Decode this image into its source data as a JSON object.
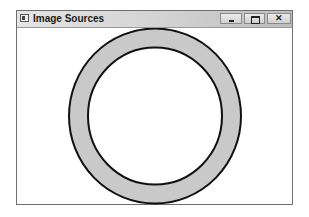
{
  "window": {
    "title": "Image Sources",
    "controls": {
      "minimize_glyph": "_",
      "maximize_glyph": "□",
      "close_glyph": "✕"
    }
  },
  "canvas": {
    "shape": "ring",
    "fill_color": "#c9c9c9",
    "stroke_color": "#111111",
    "background_color": "#ffffff"
  },
  "icons": {
    "app": "app-icon",
    "minimize": "minimize-icon",
    "maximize": "maximize-icon",
    "close": "close-icon"
  }
}
